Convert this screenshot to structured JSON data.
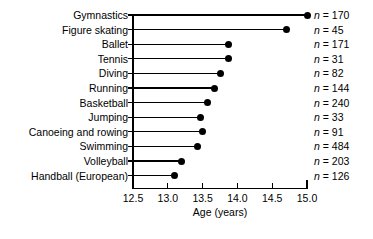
{
  "chart_data": {
    "type": "bar",
    "title": "",
    "subtitle": "",
    "xlabel": "Age (years)",
    "ylabel": "",
    "xlim": [
      12.5,
      15.0
    ],
    "xticks": [
      12.5,
      13.0,
      13.5,
      14.0,
      14.5,
      15.0
    ],
    "xtick_labels": [
      "12.5",
      "13.0",
      "13.5",
      "14.0",
      "14.5",
      "15.0"
    ],
    "grid": false,
    "legend": "none",
    "orientation": "horizontal",
    "marker": "filled-circle",
    "categories": [
      "Gymnastics",
      "Figure skating",
      "Ballet",
      "Tennis",
      "Diving",
      "Running",
      "Basketball",
      "Jumping",
      "Canoeing and rowing",
      "Swimming",
      "Volleyball",
      "Handball (European)"
    ],
    "values": [
      15.0,
      14.7,
      13.87,
      13.87,
      13.75,
      13.67,
      13.57,
      13.47,
      13.5,
      13.42,
      13.2,
      13.1
    ],
    "annotations": [
      "n = 170",
      "n = 45",
      "n = 171",
      "n = 31",
      "n = 82",
      "n = 144",
      "n = 240",
      "n = 33",
      "n = 91",
      "n = 484",
      "n = 203",
      "n = 126"
    ],
    "n_counts": [
      170,
      45,
      171,
      31,
      82,
      144,
      240,
      33,
      91,
      484,
      203,
      126
    ],
    "n_symbol": "n",
    "n_separator": " = ",
    "colors": {
      "marker": "#000000",
      "line": "#000000",
      "axis": "#000000",
      "background": "#ffffff",
      "text": "#000000"
    }
  }
}
